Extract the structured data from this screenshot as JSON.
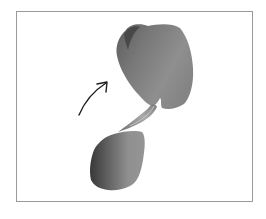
{
  "illustration": {
    "description": "Ink brush illustration of two grey wash blobs connected by a thin brush stroke, with a curved arrow pointing up-right toward the upper blob",
    "frame_color": "#9a9a9a",
    "ink_color": "#4a4a4a",
    "arrow": {
      "icon": "curved-arrow-up-right-icon",
      "color": "#1e1e1e"
    },
    "shapes": [
      {
        "name": "upper-blob",
        "tone": "#7a7a7a"
      },
      {
        "name": "lower-blob",
        "tone": "#6e6e6e"
      },
      {
        "name": "connecting-stroke",
        "tone": "#888888"
      }
    ]
  }
}
